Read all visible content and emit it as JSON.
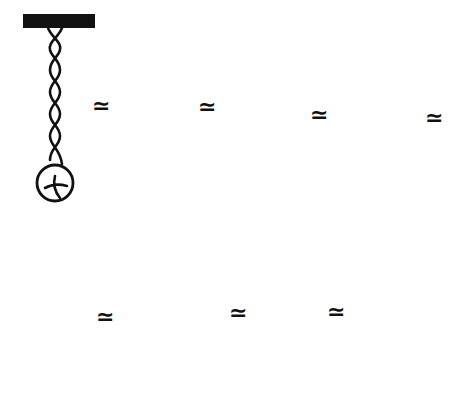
{
  "diagram": {
    "title": "",
    "relation_symbol": "≃",
    "colors": {
      "ink": "#111111",
      "background": "#ffffff"
    },
    "rows": [
      {
        "panels": [
          {
            "id": 1,
            "label": "twisted ribbon",
            "components": [
              "bar",
              "twisted-ribbon",
              "weight"
            ]
          },
          {
            "id": 2,
            "label": "two loops",
            "components": [
              "bar",
              "loop",
              "loop",
              "ribbon",
              "weight"
            ]
          },
          {
            "id": 3,
            "label": "loop and wrapped weight",
            "components": [
              "bar",
              "loop",
              "long-curve",
              "wrapped-weight"
            ]
          },
          {
            "id": 4,
            "label": "loop and spiral around weight",
            "components": [
              "bar",
              "loop",
              "long-curve",
              "spiral-weight"
            ]
          }
        ],
        "relations": [
          "≃",
          "≃",
          "≃",
          "≃"
        ]
      },
      {
        "panels": [
          {
            "id": 5,
            "label": "loop and loop at weight",
            "components": [
              "bar",
              "loop",
              "curve",
              "weight",
              "loop"
            ]
          },
          {
            "id": 6,
            "label": "two loops",
            "components": [
              "bar",
              "loop",
              "loop",
              "weight"
            ]
          },
          {
            "id": 7,
            "label": "twisted ribbon",
            "components": [
              "bar",
              "twisted-ribbon",
              "weight"
            ]
          },
          {
            "id": 8,
            "label": "straight ribbon",
            "components": [
              "bar",
              "straight-ribbon",
              "weight"
            ]
          }
        ],
        "relations": [
          "≃",
          "≃",
          "≃"
        ]
      }
    ],
    "weight_mark": "x-cross"
  }
}
